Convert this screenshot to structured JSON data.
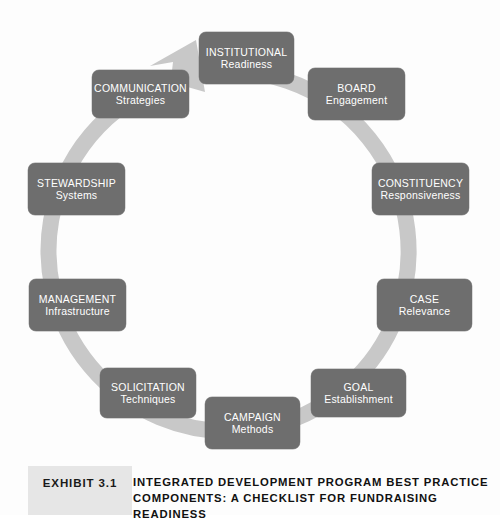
{
  "diagram": {
    "type": "cycle",
    "direction": "clockwise",
    "arrow_icon": "clockwise-arrowhead",
    "ring_color": "#c8c8c8",
    "node_fill": "#6e6e6e",
    "node_text_color": "#ffffff",
    "background_color": "#fdfdfd",
    "nodes": [
      {
        "id": "institutional",
        "title": "INSTITUTIONAL",
        "subtitle": "Readiness",
        "x": 199,
        "y": 32,
        "w": 95,
        "h": 52
      },
      {
        "id": "board",
        "title": "BOARD",
        "subtitle": "Engagement",
        "x": 308,
        "y": 68,
        "w": 97,
        "h": 52
      },
      {
        "id": "constituency",
        "title": "CONSTITUENCY",
        "subtitle": "Responsiveness",
        "x": 372,
        "y": 163,
        "w": 97,
        "h": 52
      },
      {
        "id": "case",
        "title": "CASE",
        "subtitle": "Relevance",
        "x": 377,
        "y": 279,
        "w": 95,
        "h": 52
      },
      {
        "id": "goal",
        "title": "GOAL",
        "subtitle": "Establishment",
        "x": 311,
        "y": 369,
        "w": 95,
        "h": 48
      },
      {
        "id": "campaign",
        "title": "CAMPAIGN",
        "subtitle": "Methods",
        "x": 205,
        "y": 397,
        "w": 95,
        "h": 52
      },
      {
        "id": "solicitation",
        "title": "SOLICITATION",
        "subtitle": "Techniques",
        "x": 100,
        "y": 368,
        "w": 96,
        "h": 50
      },
      {
        "id": "management",
        "title": "MANAGEMENT",
        "subtitle": "Infrastructure",
        "x": 29,
        "y": 279,
        "w": 97,
        "h": 52
      },
      {
        "id": "stewardship",
        "title": "STEWARDSHIP",
        "subtitle": "Systems",
        "x": 28,
        "y": 163,
        "w": 97,
        "h": 52
      },
      {
        "id": "communication",
        "title": "COMMUNICATION",
        "subtitle": "Strategies",
        "x": 92,
        "y": 70,
        "w": 97,
        "h": 48
      }
    ]
  },
  "caption": {
    "exhibit_label": "EXHIBIT 3.1",
    "title_line1": "INTEGRATED DEVELOPMENT PROGRAM BEST PRACTICE",
    "title_line2": "COMPONENTS: A CHECKLIST FOR FUNDRAISING",
    "title_line3": "READINESS",
    "chip_color": "#e6e6e6"
  }
}
